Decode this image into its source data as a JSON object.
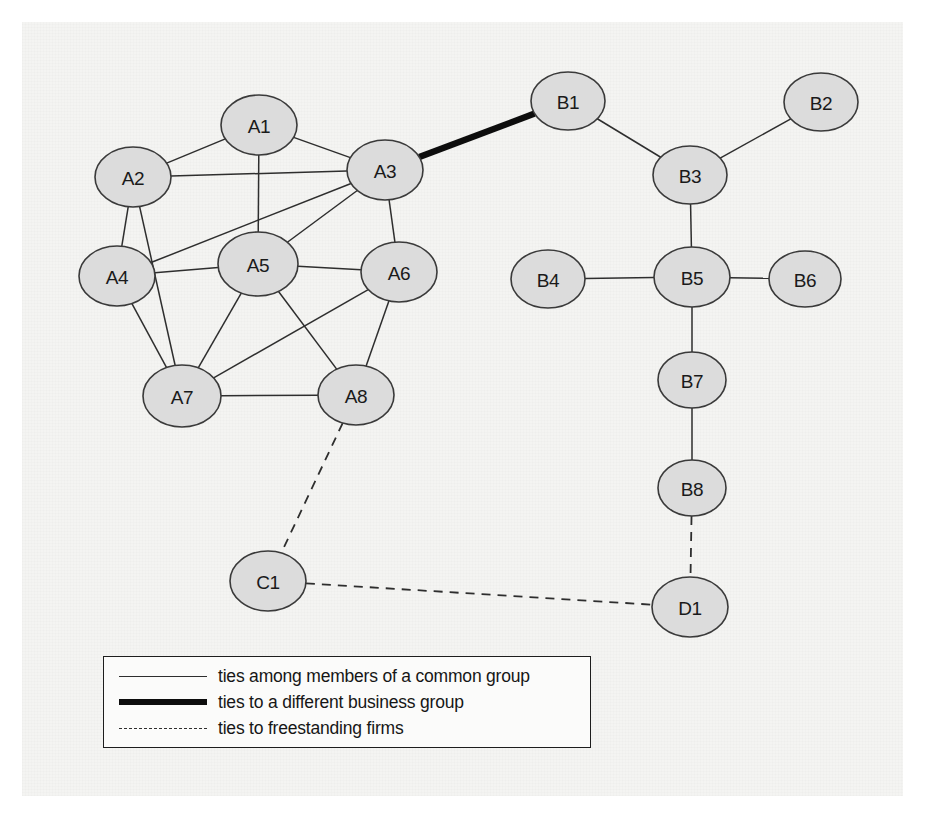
{
  "figure": {
    "type": "network-diagram",
    "background_color": "#f4f4f2",
    "node_fill_color": "#dcdcdc",
    "node_stroke_color": "#3a3a3a",
    "edge_color": "#2e2e2e"
  },
  "nodes": [
    {
      "id": "A1",
      "label": "A1",
      "group": "A",
      "x": 259,
      "y": 125,
      "rx": 38,
      "ry": 30
    },
    {
      "id": "A2",
      "label": "A2",
      "group": "A",
      "x": 133,
      "y": 177,
      "rx": 38,
      "ry": 30
    },
    {
      "id": "A3",
      "label": "A3",
      "group": "A",
      "x": 385,
      "y": 170,
      "rx": 38,
      "ry": 30
    },
    {
      "id": "A4",
      "label": "A4",
      "group": "A",
      "x": 117,
      "y": 276,
      "rx": 38,
      "ry": 30
    },
    {
      "id": "A5",
      "label": "A5",
      "group": "A",
      "x": 258,
      "y": 264,
      "rx": 40,
      "ry": 32
    },
    {
      "id": "A6",
      "label": "A6",
      "group": "A",
      "x": 399,
      "y": 272,
      "rx": 38,
      "ry": 30
    },
    {
      "id": "A7",
      "label": "A7",
      "group": "A",
      "x": 182,
      "y": 396,
      "rx": 39,
      "ry": 31
    },
    {
      "id": "A8",
      "label": "A8",
      "group": "A",
      "x": 356,
      "y": 395,
      "rx": 38,
      "ry": 30
    },
    {
      "id": "B1",
      "label": "B1",
      "group": "B",
      "x": 568,
      "y": 101,
      "rx": 37,
      "ry": 29
    },
    {
      "id": "B2",
      "label": "B2",
      "group": "B",
      "x": 821,
      "y": 102,
      "rx": 37,
      "ry": 29
    },
    {
      "id": "B3",
      "label": "B3",
      "group": "B",
      "x": 690,
      "y": 175,
      "rx": 37,
      "ry": 29
    },
    {
      "id": "B4",
      "label": "B4",
      "group": "B",
      "x": 548,
      "y": 279,
      "rx": 37,
      "ry": 29
    },
    {
      "id": "B5",
      "label": "B5",
      "group": "B",
      "x": 692,
      "y": 277,
      "rx": 38,
      "ry": 30
    },
    {
      "id": "B6",
      "label": "B6",
      "group": "B",
      "x": 805,
      "y": 279,
      "rx": 36,
      "ry": 28
    },
    {
      "id": "B7",
      "label": "B7",
      "group": "B",
      "x": 692,
      "y": 380,
      "rx": 34,
      "ry": 28
    },
    {
      "id": "B8",
      "label": "B8",
      "group": "B",
      "x": 692,
      "y": 488,
      "rx": 34,
      "ry": 28
    },
    {
      "id": "C1",
      "label": "C1",
      "group": "C",
      "x": 268,
      "y": 581,
      "rx": 38,
      "ry": 30
    },
    {
      "id": "D1",
      "label": "D1",
      "group": "D",
      "x": 690,
      "y": 607,
      "rx": 38,
      "ry": 30
    }
  ],
  "edges": [
    {
      "source": "A1",
      "target": "A2",
      "kind": "common"
    },
    {
      "source": "A1",
      "target": "A3",
      "kind": "common"
    },
    {
      "source": "A1",
      "target": "A5",
      "kind": "common"
    },
    {
      "source": "A2",
      "target": "A3",
      "kind": "common"
    },
    {
      "source": "A2",
      "target": "A4",
      "kind": "common"
    },
    {
      "source": "A2",
      "target": "A7",
      "kind": "common"
    },
    {
      "source": "A3",
      "target": "A4",
      "kind": "common"
    },
    {
      "source": "A3",
      "target": "A5",
      "kind": "common"
    },
    {
      "source": "A3",
      "target": "A6",
      "kind": "common"
    },
    {
      "source": "A4",
      "target": "A5",
      "kind": "common"
    },
    {
      "source": "A4",
      "target": "A7",
      "kind": "common"
    },
    {
      "source": "A5",
      "target": "A6",
      "kind": "common"
    },
    {
      "source": "A5",
      "target": "A7",
      "kind": "common"
    },
    {
      "source": "A5",
      "target": "A8",
      "kind": "common"
    },
    {
      "source": "A6",
      "target": "A7",
      "kind": "common"
    },
    {
      "source": "A6",
      "target": "A8",
      "kind": "common"
    },
    {
      "source": "A7",
      "target": "A8",
      "kind": "common"
    },
    {
      "source": "B1",
      "target": "B3",
      "kind": "common"
    },
    {
      "source": "B2",
      "target": "B3",
      "kind": "common"
    },
    {
      "source": "B3",
      "target": "B5",
      "kind": "common"
    },
    {
      "source": "B4",
      "target": "B5",
      "kind": "common"
    },
    {
      "source": "B5",
      "target": "B6",
      "kind": "common"
    },
    {
      "source": "B5",
      "target": "B7",
      "kind": "common"
    },
    {
      "source": "B7",
      "target": "B8",
      "kind": "common"
    },
    {
      "source": "A3",
      "target": "B1",
      "kind": "different"
    },
    {
      "source": "A8",
      "target": "C1",
      "kind": "freestanding"
    },
    {
      "source": "C1",
      "target": "D1",
      "kind": "freestanding"
    },
    {
      "source": "B8",
      "target": "D1",
      "kind": "freestanding"
    }
  ],
  "legend": {
    "items": [
      {
        "kind": "common",
        "label": "ties among members of a common group"
      },
      {
        "kind": "different",
        "label": "ties to a different business group"
      },
      {
        "kind": "freestanding",
        "label": "ties to freestanding firms"
      }
    ]
  }
}
